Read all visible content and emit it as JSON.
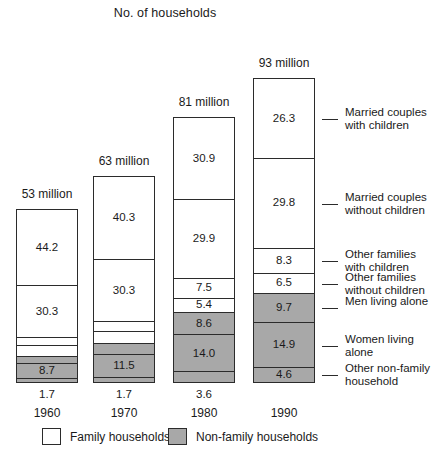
{
  "chart_data": {
    "type": "bar",
    "title": "No. of households",
    "subtitle": "",
    "xlabel": "",
    "ylabel": "",
    "stacked": true,
    "orientation": "vertical",
    "grid": false,
    "legend_position": "bottom",
    "categories": [
      "1960",
      "1970",
      "1980",
      "1990"
    ],
    "column_totals": [
      "53 million",
      "63 million",
      "81 million",
      "93 million"
    ],
    "totals_numeric": [
      53,
      63,
      81,
      93
    ],
    "series": [
      {
        "name": "Married couples with children",
        "group": "Family households",
        "values": [
          44.2,
          40.3,
          30.9,
          26.3
        ]
      },
      {
        "name": "Married couples without children",
        "group": "Family households",
        "values": [
          30.3,
          30.3,
          29.9,
          29.8
        ]
      },
      {
        "name": "Other families with children",
        "group": "Family households",
        "values": [
          4.4,
          5.0,
          7.5,
          8.3
        ]
      },
      {
        "name": "Other families without children",
        "group": "Family households",
        "values": [
          6.4,
          5.6,
          5.4,
          6.5
        ]
      },
      {
        "name": "Men living alone",
        "group": "Non-family households",
        "values": [
          4.3,
          5.6,
          8.6,
          9.7
        ]
      },
      {
        "name": "Women living alone",
        "group": "Non-family households",
        "values": [
          8.7,
          11.5,
          14.0,
          14.9
        ]
      },
      {
        "name": "Other non-family household",
        "group": "Non-family households",
        "values": [
          1.7,
          1.7,
          3.6,
          4.6
        ]
      }
    ],
    "legend": [
      {
        "label": "Family households",
        "color": "#ffffff"
      },
      {
        "label": "Non-family households",
        "color": "#a8a8a8"
      }
    ],
    "note": "Values are percentages of households in each year; bottom segment value for 1960 and 1970 is printed beneath the bar."
  },
  "colors": {
    "family_fill": "#ffffff",
    "nonfamily_fill": "#a8a8a8",
    "outline": "#2b2b2b",
    "text": "#1a1a1a",
    "background": "#ffffff"
  }
}
